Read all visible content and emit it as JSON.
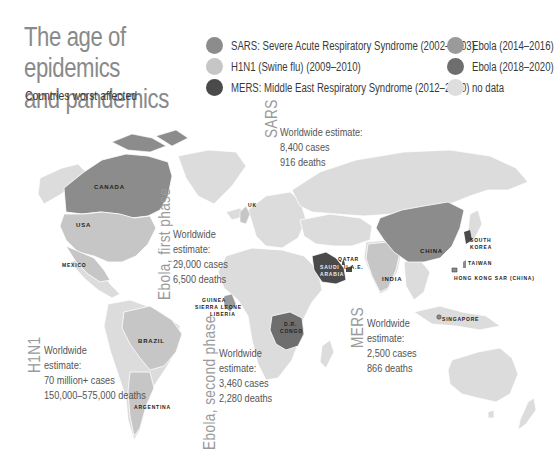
{
  "title": "The age of epidemics and pandemics",
  "title_line1": "The age of epidemics",
  "title_line2": "and pandemics",
  "subtitle": "Countries worst affected",
  "legend": [
    {
      "label": "SARS: Severe Acute Respiratory Syndrome (2002–2003)",
      "color": "#8c8c8c"
    },
    {
      "label": "H1N1 (Swine flu) (2009–2010)",
      "color": "#c6c6c6"
    },
    {
      "label": "MERS: Middle East Respiratory Syndrome (2012–2020)",
      "color": "#4a4a4a"
    },
    {
      "label": "Ebola (2014–2016)",
      "color": "#9a9a9a"
    },
    {
      "label": "Ebola (2018–2020)",
      "color": "#6e6e6e"
    },
    {
      "label": "no data",
      "color": "#dedede"
    }
  ],
  "annotations": {
    "sars": {
      "tag": "SARS",
      "line1": "Worldwide estimate:",
      "line2": "8,400 cases",
      "line3": "916 deaths"
    },
    "ebola_first": {
      "tag": "Ebola, first phase",
      "line1": "Worldwide",
      "line2": "estimate:",
      "line3": "29,000 cases",
      "line4": "6,500 deaths"
    },
    "ebola_second": {
      "tag": "Ebola, second phase",
      "line1": "Worldwide",
      "line2": "estimate:",
      "line3": "3,460 cases",
      "line4": "2,280 deaths"
    },
    "mers": {
      "tag": "MERS",
      "line1": "Worldwide",
      "line2": "estimate:",
      "line3": "2,500 cases",
      "line4": "866 deaths"
    },
    "h1n1": {
      "tag": "H1N1",
      "line1": "Worldwide",
      "line2": "estimate:",
      "line3": "70 million+ cases",
      "line4": "150,000–575,000 deaths"
    }
  },
  "country_labels": {
    "canada": "CANADA",
    "usa": "USA",
    "mexico": "MEXICO",
    "uk": "UK",
    "qatar": "QATAR",
    "saudi_arabia_1": "SAUDI",
    "saudi_arabia_2": "ARABIA",
    "uae": "U.A.E.",
    "guinea": "GUINEA",
    "sierra_leone": "SIERRA LEONE",
    "liberia": "LIBERIA",
    "drc_1": "D.R.",
    "drc_2": "CONGO",
    "china": "CHINA",
    "india": "INDIA",
    "south_korea_1": "SOUTH",
    "south_korea_2": "KOREA",
    "taiwan": "TAIWAN",
    "hong_kong": "HONG KONG SAR (CHINA)",
    "singapore": "SINGAPORE",
    "brazil": "BRAZIL",
    "argentina": "ARGENTINA"
  },
  "colors": {
    "land": "#dcdcdc",
    "sars": "#8c8c8c",
    "h1n1": "#c6c6c6",
    "mers": "#4a4a4a",
    "ebola1": "#9a9a9a",
    "ebola2": "#6e6e6e"
  }
}
